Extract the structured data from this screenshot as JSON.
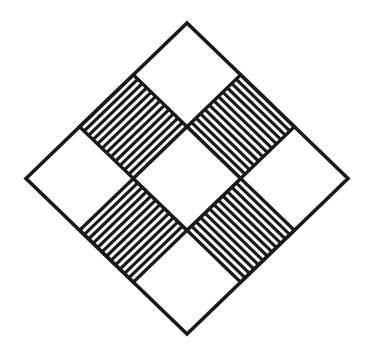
{
  "figure": {
    "canvas": {
      "width": 379,
      "height": 358,
      "background": "#ffffff"
    },
    "stroke": {
      "color": "#1a1a1a",
      "outline_width": 3.6,
      "cell_width": 3.4,
      "stripe_width": 3.2
    },
    "geometry": {
      "center_x": 187,
      "center_y": 178.5,
      "half_diagonal_x": 161,
      "half_diagonal_y": 155.5,
      "rotation_degrees": 45,
      "grid_rows": 3,
      "grid_cols": 3
    },
    "vertices": {
      "top": {
        "x": 187,
        "y": 23
      },
      "right": {
        "x": 348,
        "y": 178.5
      },
      "bottom": {
        "x": 187,
        "y": 334
      },
      "left": {
        "x": 26,
        "y": 178.5
      }
    },
    "cells": [
      {
        "row": 0,
        "col": 0,
        "name": "cell-left-corner",
        "fill": "blank"
      },
      {
        "row": 0,
        "col": 1,
        "name": "cell-upper-left-hatched",
        "fill": "hatched",
        "stripe_direction": "backslash",
        "stripe_count": 11
      },
      {
        "row": 0,
        "col": 2,
        "name": "cell-top-corner",
        "fill": "blank"
      },
      {
        "row": 1,
        "col": 0,
        "name": "cell-lower-left-hatched",
        "fill": "hatched",
        "stripe_direction": "backslash",
        "stripe_count": 11
      },
      {
        "row": 1,
        "col": 1,
        "name": "cell-center",
        "fill": "blank"
      },
      {
        "row": 1,
        "col": 2,
        "name": "cell-upper-right-hatched",
        "fill": "hatched",
        "stripe_direction": "slash",
        "stripe_count": 11
      },
      {
        "row": 2,
        "col": 0,
        "name": "cell-bottom-corner",
        "fill": "blank"
      },
      {
        "row": 2,
        "col": 1,
        "name": "cell-lower-right-hatched",
        "fill": "hatched",
        "stripe_direction": "slash",
        "stripe_count": 11
      },
      {
        "row": 2,
        "col": 2,
        "name": "cell-right-corner",
        "fill": "blank"
      }
    ]
  }
}
